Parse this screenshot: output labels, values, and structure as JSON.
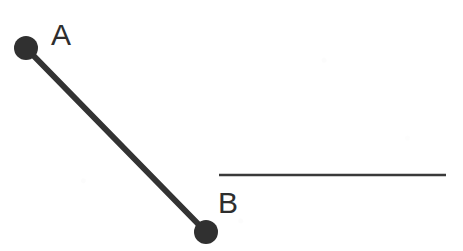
{
  "figure": {
    "type": "geometry-line-diagram",
    "width": 463,
    "height": 251,
    "background_color": "#fdfdfd",
    "ink_color": "#333333",
    "labels": {
      "point_a": "A",
      "point_b": "B"
    },
    "points": [
      {
        "name": "A",
        "label": "A",
        "cx": 26,
        "cy": 48,
        "r": 12,
        "color": "#303030",
        "label_x": 51,
        "label_y": 20
      },
      {
        "name": "B",
        "label": "B",
        "cx": 206,
        "cy": 232,
        "r": 12,
        "color": "#303030",
        "label_x": 218,
        "label_y": 188
      }
    ],
    "segments": [
      {
        "name": "segment-ab",
        "x1": 26,
        "y1": 48,
        "x2": 206,
        "y2": 232,
        "stroke_width": 6,
        "color": "#333333"
      },
      {
        "name": "horizontal-line",
        "x1": 219,
        "y1": 175,
        "x2": 446,
        "y2": 175,
        "stroke_width": 2.6,
        "color": "#3a3a3a"
      }
    ]
  }
}
